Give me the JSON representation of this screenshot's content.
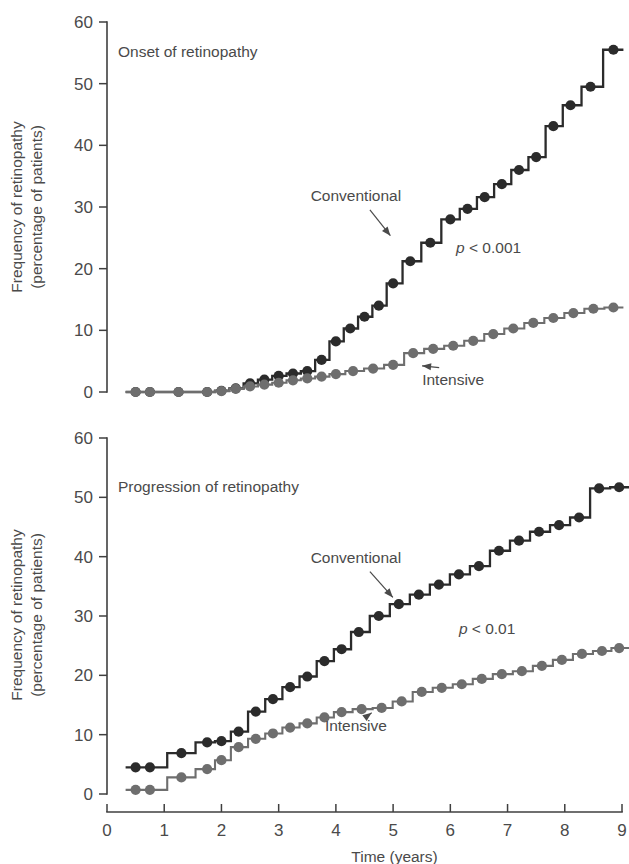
{
  "figure": {
    "xlabel": "Time (years)",
    "ylabel_line1": "Frequency of retinopathy",
    "ylabel_line2": "(percentage of patients)",
    "colors": {
      "conventional": "#2b2b2b",
      "intensive": "#6e6e6e",
      "axis": "#3f3f3f",
      "text": "#4a4a4a",
      "background": "#ffffff"
    }
  },
  "chart_data": [
    {
      "type": "line",
      "id": "onset",
      "title": "Onset of retinopathy",
      "xlabel": "Time (years)",
      "ylabel": "Frequency of retinopathy (percentage of patients)",
      "xlim": [
        0,
        9
      ],
      "ylim": [
        0,
        60
      ],
      "xticks": [
        0,
        1,
        2,
        3,
        4,
        5,
        6,
        7,
        8,
        9
      ],
      "yticks": [
        0,
        10,
        20,
        30,
        40,
        50,
        60
      ],
      "grid": false,
      "legend_position": "inline-annotations",
      "annotations": [
        {
          "text": "p < 0.001",
          "italic_prefix": "p",
          "rest": " < 0.001",
          "x": 6.1,
          "y": 22.5
        },
        {
          "text": "Conventional",
          "x": 4.35,
          "y": 31.0,
          "points_to": [
            5.05,
            24.2
          ]
        },
        {
          "text": "Intensive",
          "x": 6.05,
          "y": 1.2,
          "points_to": [
            5.35,
            4.4
          ]
        }
      ],
      "series": [
        {
          "name": "Conventional",
          "color": "#2b2b2b",
          "x": [
            0.5,
            0.75,
            1.25,
            1.75,
            2.0,
            2.25,
            2.5,
            2.75,
            3.0,
            3.25,
            3.5,
            3.75,
            4.0,
            4.25,
            4.5,
            4.75,
            5.0,
            5.3,
            5.65,
            6.0,
            6.3,
            6.6,
            6.9,
            7.2,
            7.5,
            7.8,
            8.1,
            8.45,
            8.85
          ],
          "values": [
            0.0,
            0.0,
            0.0,
            0.0,
            0.2,
            0.6,
            1.4,
            2.0,
            2.6,
            3.0,
            3.4,
            5.2,
            8.2,
            10.3,
            12.2,
            14.0,
            17.6,
            21.2,
            24.2,
            28.0,
            29.7,
            31.6,
            33.7,
            36.0,
            38.1,
            43.1,
            46.5,
            49.5,
            55.5
          ]
        },
        {
          "name": "Intensive",
          "color": "#6e6e6e",
          "x": [
            0.5,
            0.75,
            1.25,
            1.75,
            2.0,
            2.25,
            2.5,
            2.75,
            3.0,
            3.25,
            3.5,
            3.75,
            4.0,
            4.3,
            4.65,
            5.0,
            5.35,
            5.7,
            6.05,
            6.4,
            6.75,
            7.1,
            7.45,
            7.8,
            8.15,
            8.5,
            8.85
          ],
          "values": [
            0.0,
            0.0,
            0.0,
            0.0,
            0.15,
            0.5,
            0.9,
            1.2,
            1.5,
            1.9,
            2.2,
            2.5,
            2.9,
            3.4,
            3.8,
            4.4,
            6.3,
            7.0,
            7.5,
            8.3,
            9.4,
            10.3,
            11.2,
            12.0,
            12.8,
            13.5,
            13.7
          ]
        }
      ]
    },
    {
      "type": "line",
      "id": "progression",
      "title": "Progression of retinopathy",
      "xlabel": "Time (years)",
      "ylabel": "Frequency of retinopathy (percentage of patients)",
      "xlim": [
        0,
        9
      ],
      "ylim": [
        0,
        60
      ],
      "xticks": [
        0,
        1,
        2,
        3,
        4,
        5,
        6,
        7,
        8,
        9
      ],
      "yticks": [
        0,
        10,
        20,
        30,
        40,
        50,
        60
      ],
      "grid": false,
      "legend_position": "inline-annotations",
      "annotations": [
        {
          "text": "p < 0.01",
          "italic_prefix": "p",
          "rest": " < 0.01",
          "x": 6.15,
          "y": 27.0
        },
        {
          "text": "Conventional",
          "x": 4.35,
          "y": 39.0,
          "points_to": [
            5.1,
            32.0
          ]
        },
        {
          "text": "Intensive",
          "x": 4.35,
          "y": 10.6,
          "points_to": [
            4.75,
            14.6
          ]
        }
      ],
      "series": [
        {
          "name": "Conventional",
          "color": "#2b2b2b",
          "x": [
            0.5,
            0.75,
            1.3,
            1.75,
            2.0,
            2.3,
            2.6,
            2.9,
            3.2,
            3.5,
            3.8,
            4.1,
            4.4,
            4.75,
            5.1,
            5.45,
            5.8,
            6.15,
            6.5,
            6.85,
            7.2,
            7.55,
            7.9,
            8.25,
            8.6,
            8.95
          ],
          "values": [
            4.5,
            4.5,
            6.9,
            8.7,
            8.9,
            10.5,
            13.9,
            16.0,
            18.0,
            19.8,
            22.4,
            24.4,
            27.3,
            30.0,
            32.0,
            33.6,
            35.3,
            37.0,
            38.4,
            41.0,
            42.7,
            44.2,
            45.3,
            46.6,
            51.5,
            51.7
          ]
        },
        {
          "name": "Intensive",
          "color": "#6e6e6e",
          "x": [
            0.5,
            0.75,
            1.3,
            1.75,
            2.0,
            2.3,
            2.6,
            2.9,
            3.2,
            3.5,
            3.8,
            4.1,
            4.45,
            4.8,
            5.15,
            5.5,
            5.85,
            6.2,
            6.55,
            6.9,
            7.25,
            7.6,
            7.95,
            8.3,
            8.65,
            8.95
          ],
          "values": [
            0.7,
            0.7,
            2.8,
            4.2,
            5.7,
            7.9,
            9.3,
            10.2,
            11.2,
            11.9,
            12.9,
            13.8,
            14.3,
            14.5,
            15.6,
            17.2,
            17.9,
            18.5,
            19.4,
            20.2,
            20.7,
            21.6,
            22.6,
            23.6,
            24.1,
            24.6
          ]
        }
      ]
    }
  ]
}
